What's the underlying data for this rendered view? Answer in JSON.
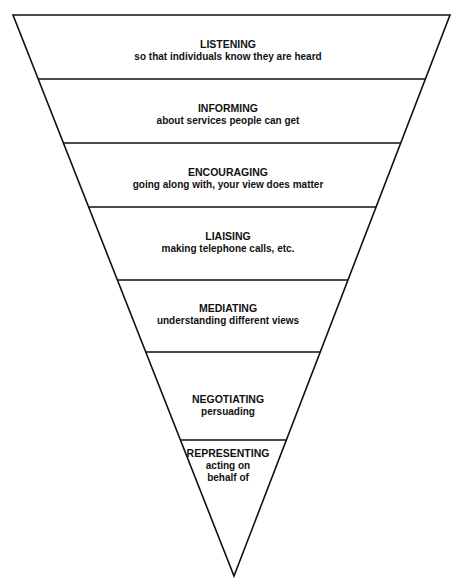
{
  "diagram": {
    "type": "inverted-pyramid",
    "line_color": "#111111",
    "background": "#ffffff",
    "layers": [
      {
        "title": "LISTENING",
        "subtitle": [
          "so that individuals know they are heard"
        ]
      },
      {
        "title": "INFORMING",
        "subtitle": [
          "about services people can get"
        ]
      },
      {
        "title": "ENCOURAGING",
        "subtitle": [
          "going along with, your view does matter"
        ]
      },
      {
        "title": "LIAISING",
        "subtitle": [
          "making telephone calls, etc."
        ]
      },
      {
        "title": "MEDIATING",
        "subtitle": [
          "understanding different views"
        ]
      },
      {
        "title": "NEGOTIATING",
        "subtitle": [
          "persuading"
        ]
      },
      {
        "title": "REPRESENTING",
        "subtitle": [
          "acting on",
          "behalf of"
        ]
      }
    ]
  }
}
